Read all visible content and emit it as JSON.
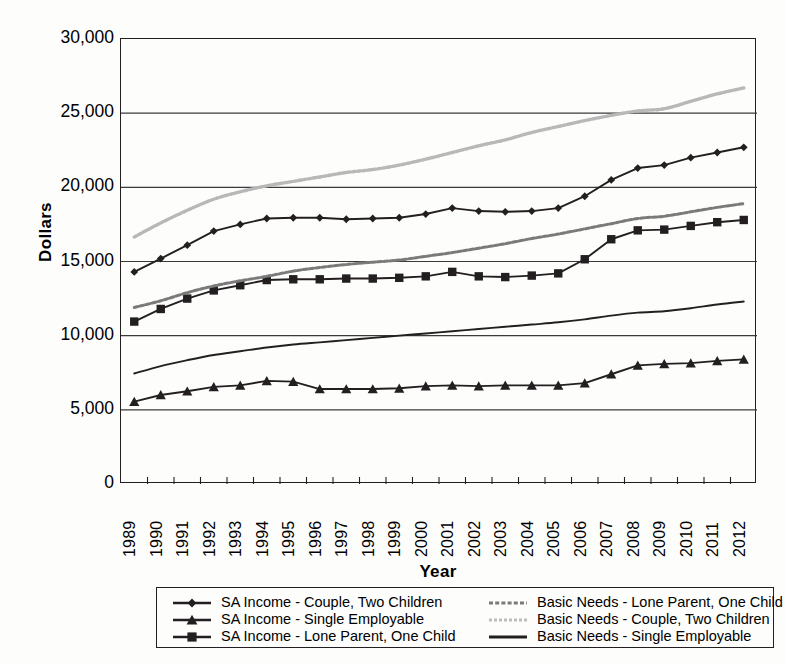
{
  "chart_data": {
    "type": "line",
    "title": "",
    "xlabel": "Year",
    "ylabel": "Dollars",
    "ylim": [
      0,
      30000
    ],
    "yticks": [
      0,
      5000,
      10000,
      15000,
      20000,
      25000,
      30000
    ],
    "ytick_labels": [
      "0",
      "5,000",
      "10,000",
      "15,000",
      "20,000",
      "25,000",
      "30,000"
    ],
    "grid": "horizontal",
    "legend_position": "bottom",
    "categories": [
      "1989",
      "1990",
      "1991",
      "1992",
      "1993",
      "1994",
      "1995",
      "1996",
      "1997",
      "1998",
      "1999",
      "2000",
      "2001",
      "2002",
      "2003",
      "2004",
      "2005",
      "2006",
      "2007",
      "2008",
      "2009",
      "2010",
      "2011",
      "2012"
    ],
    "series": [
      {
        "name": "SA Income - Couple, Two Children",
        "marker": "diamond",
        "style": "solid-marker",
        "color": "#231f20",
        "values": [
          14300,
          15200,
          16100,
          17050,
          17500,
          17900,
          17950,
          17950,
          17850,
          17900,
          17950,
          18200,
          18600,
          18400,
          18350,
          18400,
          18600,
          19400,
          20500,
          21300,
          21500,
          22000,
          22350,
          22700
        ]
      },
      {
        "name": "SA Income - Single Employable",
        "marker": "triangle",
        "style": "solid-marker",
        "color": "#231f20",
        "values": [
          5550,
          6000,
          6250,
          6550,
          6650,
          6950,
          6900,
          6400,
          6400,
          6400,
          6450,
          6600,
          6650,
          6600,
          6650,
          6650,
          6650,
          6800,
          7400,
          8000,
          8100,
          8150,
          8300,
          8400
        ]
      },
      {
        "name": "SA Income - Lone Parent, One Child",
        "marker": "square",
        "style": "solid-marker",
        "color": "#231f20",
        "values": [
          10950,
          11800,
          12500,
          13050,
          13400,
          13750,
          13800,
          13800,
          13850,
          13850,
          13900,
          14000,
          14300,
          14000,
          13950,
          14050,
          14200,
          15150,
          16500,
          17100,
          17150,
          17400,
          17650,
          17800
        ]
      },
      {
        "name": "Basic Needs - Lone Parent, One Child",
        "marker": "none",
        "style": "dashed-gray",
        "color": "#7a7a7a",
        "values": [
          11900,
          12350,
          12900,
          13350,
          13700,
          14000,
          14350,
          14600,
          14800,
          14950,
          15100,
          15350,
          15600,
          15900,
          16200,
          16550,
          16850,
          17200,
          17550,
          17900,
          18050,
          18350,
          18650,
          18900
        ]
      },
      {
        "name": "Basic Needs - Couple, Two Children",
        "marker": "none",
        "style": "dotted-lightgray",
        "color": "#b8b8b8",
        "values": [
          16650,
          17600,
          18450,
          19200,
          19700,
          20100,
          20400,
          20700,
          21000,
          21200,
          21500,
          21900,
          22350,
          22800,
          23200,
          23700,
          24100,
          24500,
          24850,
          25150,
          25300,
          25800,
          26300,
          26700
        ]
      },
      {
        "name": "Basic Needs - Single Employable",
        "marker": "none",
        "style": "solid-thin",
        "color": "#231f20",
        "values": [
          7450,
          7950,
          8350,
          8700,
          8950,
          9200,
          9400,
          9550,
          9700,
          9850,
          10000,
          10150,
          10300,
          10450,
          10600,
          10750,
          10900,
          11100,
          11350,
          11550,
          11650,
          11850,
          12100,
          12300
        ]
      }
    ]
  },
  "legend": {
    "columns": [
      {
        "items": [
          {
            "label": "SA Income - Couple, Two Children",
            "marker": "diamond"
          },
          {
            "label": "SA Income - Single Employable",
            "marker": "triangle"
          },
          {
            "label": "SA Income - Lone Parent, One Child",
            "marker": "square"
          }
        ]
      },
      {
        "items": [
          {
            "label": "Basic Needs - Lone Parent, One Child",
            "marker": "dashed-gray"
          },
          {
            "label": "Basic Needs - Couple, Two Children",
            "marker": "dotted-lightgray"
          },
          {
            "label": "Basic Needs - Single Employable",
            "marker": "solid-thin"
          }
        ]
      }
    ]
  }
}
